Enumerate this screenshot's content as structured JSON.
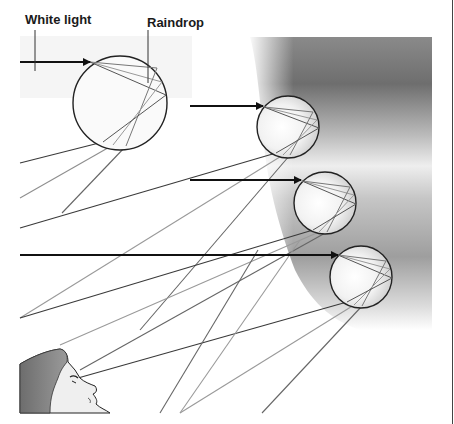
{
  "labels": {
    "white_light": "White light",
    "raindrop": "Raindrop"
  },
  "elements": {
    "drops": [
      {
        "cx": 120,
        "cy": 103,
        "r": 47,
        "tinted": false
      },
      {
        "cx": 288,
        "cy": 127,
        "r": 31,
        "tinted": true
      },
      {
        "cx": 325,
        "cy": 203,
        "r": 31,
        "tinted": true
      },
      {
        "cx": 361,
        "cy": 277,
        "r": 31,
        "tinted": true
      }
    ],
    "incoming_rays": [
      {
        "x1": 20,
        "y1": 62,
        "x2": 90,
        "y2": 62
      },
      {
        "x1": 190,
        "y1": 106,
        "x2": 263,
        "y2": 106
      },
      {
        "x1": 190,
        "y1": 180,
        "x2": 301,
        "y2": 180
      },
      {
        "x1": 20,
        "y1": 255,
        "x2": 340,
        "y2": 255
      }
    ],
    "observer": "face-profile-looking-up"
  },
  "colors": {
    "ray_dark": "#3a3a3a",
    "ray_mid": "#666666",
    "ray_light": "#9a9a9a",
    "outline": "#222222",
    "shade_dark": "#7a7a7a",
    "shade_light": "#d8d8d8",
    "panel_bg": "#f4f4f4",
    "hair": "#7c7c7c",
    "skin": "#ededed"
  }
}
